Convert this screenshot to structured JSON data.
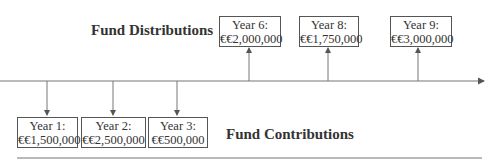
{
  "diagram": {
    "distributions_heading": "Fund Distributions",
    "contributions_heading": "Fund Contributions",
    "distributions": [
      {
        "year": "Year 6:",
        "amount": "€€2,000,000"
      },
      {
        "year": "Year 8:",
        "amount": "€€1,750,000"
      },
      {
        "year": "Year 9:",
        "amount": "€€3,000,000"
      }
    ],
    "contributions": [
      {
        "year": "Year 1:",
        "amount": "€€1,500,000"
      },
      {
        "year": "Year 2:",
        "amount": "€€2,500,000"
      },
      {
        "year": "Year 3:",
        "amount": "€€500,000"
      }
    ],
    "colors": {
      "line": "#666666",
      "box_border": "#555555",
      "text": "#333333"
    }
  }
}
